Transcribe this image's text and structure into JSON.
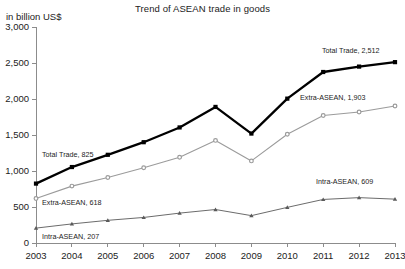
{
  "chart_data": {
    "type": "line",
    "title": "Trend of ASEAN trade in goods",
    "ylabel": "in billion US$",
    "xlabel": "",
    "x": [
      "2003",
      "2004",
      "2005",
      "2006",
      "2007",
      "2008",
      "2009",
      "2010",
      "2011",
      "2012",
      "2013"
    ],
    "ylim": [
      0,
      3000
    ],
    "ytick_labels": [
      "0",
      "500",
      "1,000",
      "1,500",
      "2,000",
      "2,500",
      "3,000"
    ],
    "ytick_values": [
      0,
      500,
      1000,
      1500,
      2000,
      2500,
      3000
    ],
    "grid": false,
    "legend": "inline-annotations",
    "series": [
      {
        "name": "Total Trade",
        "marker": "square",
        "color": "#000000",
        "values": [
          825,
          1055,
          1225,
          1400,
          1605,
          1890,
          1520,
          2005,
          2375,
          2450,
          2512
        ],
        "start_annotation": "Total Trade, 825",
        "end_annotation": "Total Trade, 2,512"
      },
      {
        "name": "Extra-ASEAN",
        "marker": "circle",
        "color": "#9b9b9b",
        "values": [
          618,
          790,
          910,
          1045,
          1190,
          1425,
          1140,
          1510,
          1770,
          1820,
          1903
        ],
        "start_annotation": "Extra-ASEAN, 618",
        "end_annotation": "Extra-ASEAN, 1,903"
      },
      {
        "name": "Intra-ASEAN",
        "marker": "triangle",
        "color": "#5a5a5a",
        "values": [
          207,
          265,
          315,
          355,
          415,
          465,
          380,
          495,
          605,
          630,
          609
        ],
        "start_annotation": "Intra-ASEAN, 207",
        "end_annotation": "Intra-ASEAN, 609"
      }
    ]
  }
}
